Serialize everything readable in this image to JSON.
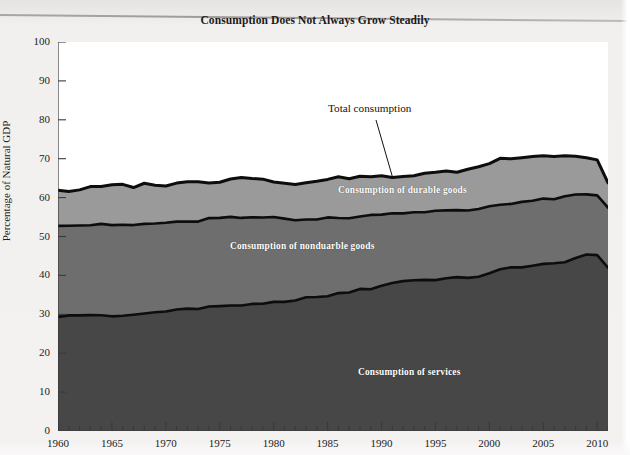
{
  "title": "Consumption Does Not Always Grow Steadily",
  "axes": {
    "ylabel": "Percentage of Natural GDP",
    "yticks": [
      "0",
      "10",
      "20",
      "30",
      "40",
      "50",
      "60",
      "70",
      "80",
      "90",
      "100"
    ],
    "xticks": [
      "1960",
      "1965",
      "1970",
      "1975",
      "1980",
      "1985",
      "1990",
      "1995",
      "2000",
      "2005",
      "2010"
    ]
  },
  "annotations": {
    "total": "Total consumption",
    "durables": "Consumption of durable goods",
    "nondurables": "Consumption of nonduarble goods",
    "services": "Consumption of services"
  },
  "colors": {
    "durables_band": "#9a9a9a",
    "nondurables_band": "#6e6e6e",
    "services_band": "#474747",
    "line": "#0d0d0d",
    "plot_background": "#ffffff",
    "page_background": "#f1efee",
    "text": "#1a1a1a"
  },
  "chart_data": {
    "type": "area",
    "title": "Consumption Does Not Always Grow Steadily",
    "xlabel": "",
    "ylabel": "Percentage of Natural GDP",
    "xlim": [
      1960,
      2011
    ],
    "ylim": [
      0,
      100
    ],
    "grid": false,
    "legend": "inline-band-labels",
    "stacked": true,
    "note": "Stacked bands: services (bottom), nondurable goods (middle), durable goods (top). Top line is total consumption.",
    "x": [
      1960,
      1961,
      1962,
      1963,
      1964,
      1965,
      1966,
      1967,
      1968,
      1969,
      1970,
      1971,
      1972,
      1973,
      1974,
      1975,
      1976,
      1977,
      1978,
      1979,
      1980,
      1981,
      1982,
      1983,
      1984,
      1985,
      1986,
      1987,
      1988,
      1989,
      1990,
      1991,
      1992,
      1993,
      1994,
      1995,
      1996,
      1997,
      1998,
      1999,
      2000,
      2001,
      2002,
      2003,
      2004,
      2005,
      2006,
      2007,
      2008,
      2009,
      2010,
      2011
    ],
    "series": [
      {
        "name": "Consumption of services",
        "values": [
          29.5,
          29.6,
          29.7,
          29.8,
          29.9,
          29.3,
          29.5,
          29.9,
          30.2,
          30.5,
          31.0,
          31.2,
          31.4,
          31.4,
          31.8,
          32.2,
          32.3,
          32.4,
          32.4,
          32.6,
          33.0,
          33.0,
          33.8,
          34.3,
          34.2,
          34.8,
          35.3,
          35.8,
          36.3,
          36.6,
          37.4,
          38.0,
          38.6,
          38.8,
          38.8,
          39.0,
          39.2,
          39.3,
          39.5,
          39.8,
          40.4,
          41.4,
          42.0,
          42.3,
          42.5,
          42.8,
          43.0,
          43.6,
          44.5,
          45.1,
          45.0,
          42.0
        ]
      },
      {
        "name": "Consumption of nondurable goods",
        "values": [
          23.5,
          23.4,
          23.2,
          23.2,
          23.1,
          23.6,
          23.5,
          23.0,
          23.0,
          22.8,
          22.6,
          22.4,
          22.3,
          22.6,
          22.8,
          22.5,
          22.5,
          22.4,
          22.3,
          22.3,
          22.0,
          21.6,
          20.6,
          20.3,
          20.2,
          19.9,
          19.4,
          19.1,
          18.8,
          18.8,
          18.5,
          17.9,
          17.6,
          17.5,
          17.6,
          17.5,
          17.4,
          17.3,
          17.2,
          17.3,
          17.4,
          16.8,
          16.6,
          16.6,
          16.7,
          16.7,
          16.7,
          16.5,
          16.2,
          15.6,
          15.5,
          15.5
        ]
      },
      {
        "name": "Consumption of durable goods",
        "values": [
          9.0,
          8.6,
          9.2,
          9.6,
          9.8,
          10.2,
          10.3,
          9.9,
          10.3,
          10.1,
          9.5,
          10.0,
          10.3,
          10.3,
          9.4,
          9.4,
          10.0,
          10.4,
          10.4,
          10.1,
          9.2,
          9.0,
          8.8,
          9.4,
          10.0,
          10.2,
          10.4,
          10.2,
          10.2,
          10.0,
          9.6,
          9.1,
          9.2,
          9.5,
          9.9,
          9.9,
          10.0,
          10.1,
          10.5,
          10.9,
          11.0,
          11.8,
          11.6,
          11.6,
          11.5,
          11.3,
          11.0,
          10.7,
          10.0,
          9.5,
          9.3,
          6.3
        ]
      }
    ],
    "total_consumption": [
      62.0,
      61.6,
      62.1,
      62.6,
      62.8,
      63.1,
      63.3,
      62.8,
      63.5,
      63.4,
      63.1,
      63.6,
      64.0,
      64.3,
      64.0,
      64.1,
      64.8,
      65.2,
      65.1,
      65.0,
      64.2,
      63.6,
      63.2,
      64.0,
      64.4,
      64.9,
      65.1,
      65.1,
      65.3,
      65.4,
      65.5,
      65.0,
      65.4,
      65.8,
      66.3,
      66.4,
      66.6,
      66.7,
      67.2,
      68.0,
      68.8,
      70.0,
      70.2,
      70.5,
      70.7,
      70.8,
      70.7,
      70.8,
      70.7,
      70.2,
      69.8,
      63.8
    ]
  }
}
